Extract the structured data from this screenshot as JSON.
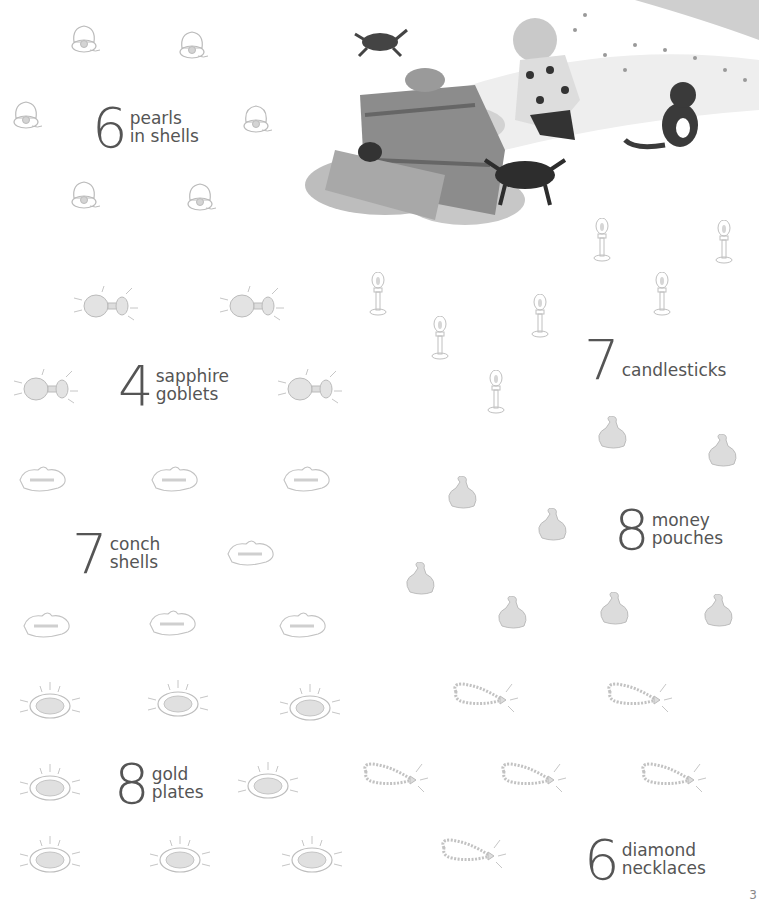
{
  "page": {
    "page_number": "3",
    "background": "#ffffff",
    "text_color": "#555555",
    "icon_color": "#b8b8b8"
  },
  "illustration": {
    "description": "boy opening treasure chest with cats, crab and spilled coins"
  },
  "groups": [
    {
      "id": "pearls",
      "count": "6",
      "line1": "pearls",
      "line2": "in shells",
      "icon": "pearl-shell-icon"
    },
    {
      "id": "goblets",
      "count": "4",
      "line1": "sapphire",
      "line2": "goblets",
      "icon": "goblet-icon"
    },
    {
      "id": "conch",
      "count": "7",
      "line1": "conch",
      "line2": "shells",
      "icon": "conch-shell-icon"
    },
    {
      "id": "plates",
      "count": "8",
      "line1": "gold",
      "line2": "plates",
      "icon": "gold-plate-icon"
    },
    {
      "id": "candlesticks",
      "count": "7",
      "line1": "candlesticks",
      "line2": "",
      "icon": "candlestick-icon"
    },
    {
      "id": "pouches",
      "count": "8",
      "line1": "money",
      "line2": "pouches",
      "icon": "money-pouch-icon"
    },
    {
      "id": "necklaces",
      "count": "6",
      "line1": "diamond",
      "line2": "necklaces",
      "icon": "diamond-necklace-icon"
    }
  ]
}
